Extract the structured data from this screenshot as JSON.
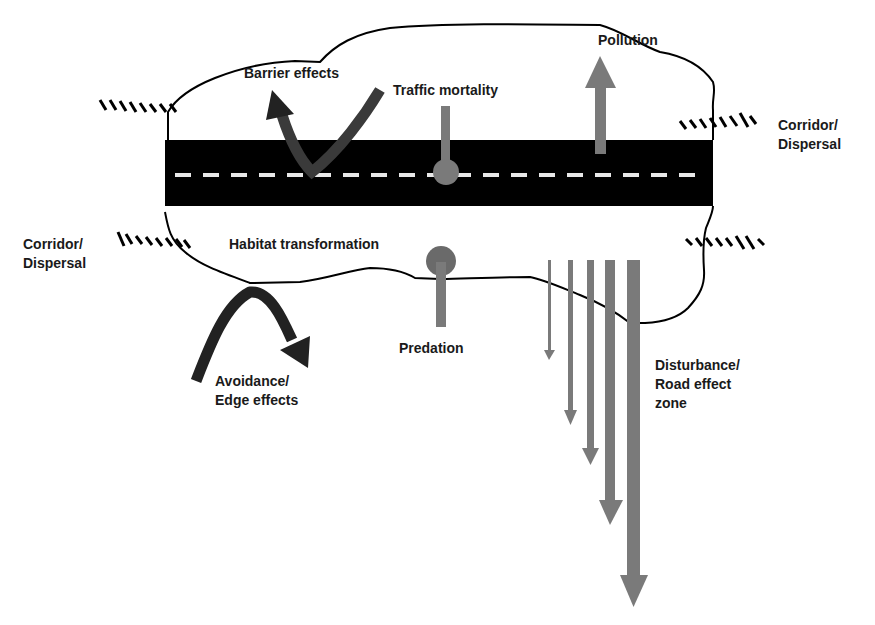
{
  "diagram": {
    "type": "road ecological effects schematic",
    "colors": {
      "road": "#000000",
      "lane_marking": "#e8e8e8",
      "effect_arrow_gray": "#7a7a7a",
      "dark_arrow": "#2e2e2e",
      "outline": "#000000"
    },
    "labels": {
      "barrier": "Barrier effects",
      "traffic": "Traffic mortality",
      "pollution": "Pollution",
      "corridor_right_1": "Corridor/",
      "corridor_right_2": "Dispersal",
      "corridor_left_1": "Corridor/",
      "corridor_left_2": "Dispersal",
      "habitat": "Habitat transformation",
      "predation": "Predation",
      "avoidance_1": "Avoidance/",
      "avoidance_2": "Edge effects",
      "disturbance_1": "Disturbance/",
      "disturbance_2": "Road effect",
      "disturbance_3": "zone"
    },
    "icons": {
      "road": "road-band",
      "barrier": "curved-bounce-arrow",
      "traffic": "pin-marker",
      "pollution": "up-arrow",
      "corridor": "hatched-line",
      "predation": "pin-marker",
      "avoidance": "curved-arrow",
      "disturbance": "graduated-down-arrows"
    },
    "disturbance_arrows": [
      {
        "x": 549,
        "end_y": 360,
        "width": 3
      },
      {
        "x": 570,
        "end_y": 425,
        "width": 5
      },
      {
        "x": 590,
        "end_y": 465,
        "width": 7
      },
      {
        "x": 610,
        "end_y": 525,
        "width": 10
      },
      {
        "x": 633,
        "end_y": 607,
        "width": 13
      }
    ]
  }
}
